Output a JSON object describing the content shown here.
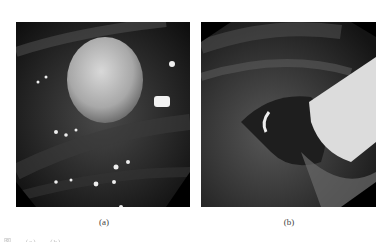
{
  "figure": {
    "panels": [
      {
        "id": "a",
        "label": "(a)",
        "description": "endoscopic view of rounded polypoid lesion"
      },
      {
        "id": "b",
        "label": "(b)",
        "description": "endoscopic view after resection with clip/snare"
      }
    ],
    "caption_partial": "图 ... (a) ... (b) ..."
  }
}
